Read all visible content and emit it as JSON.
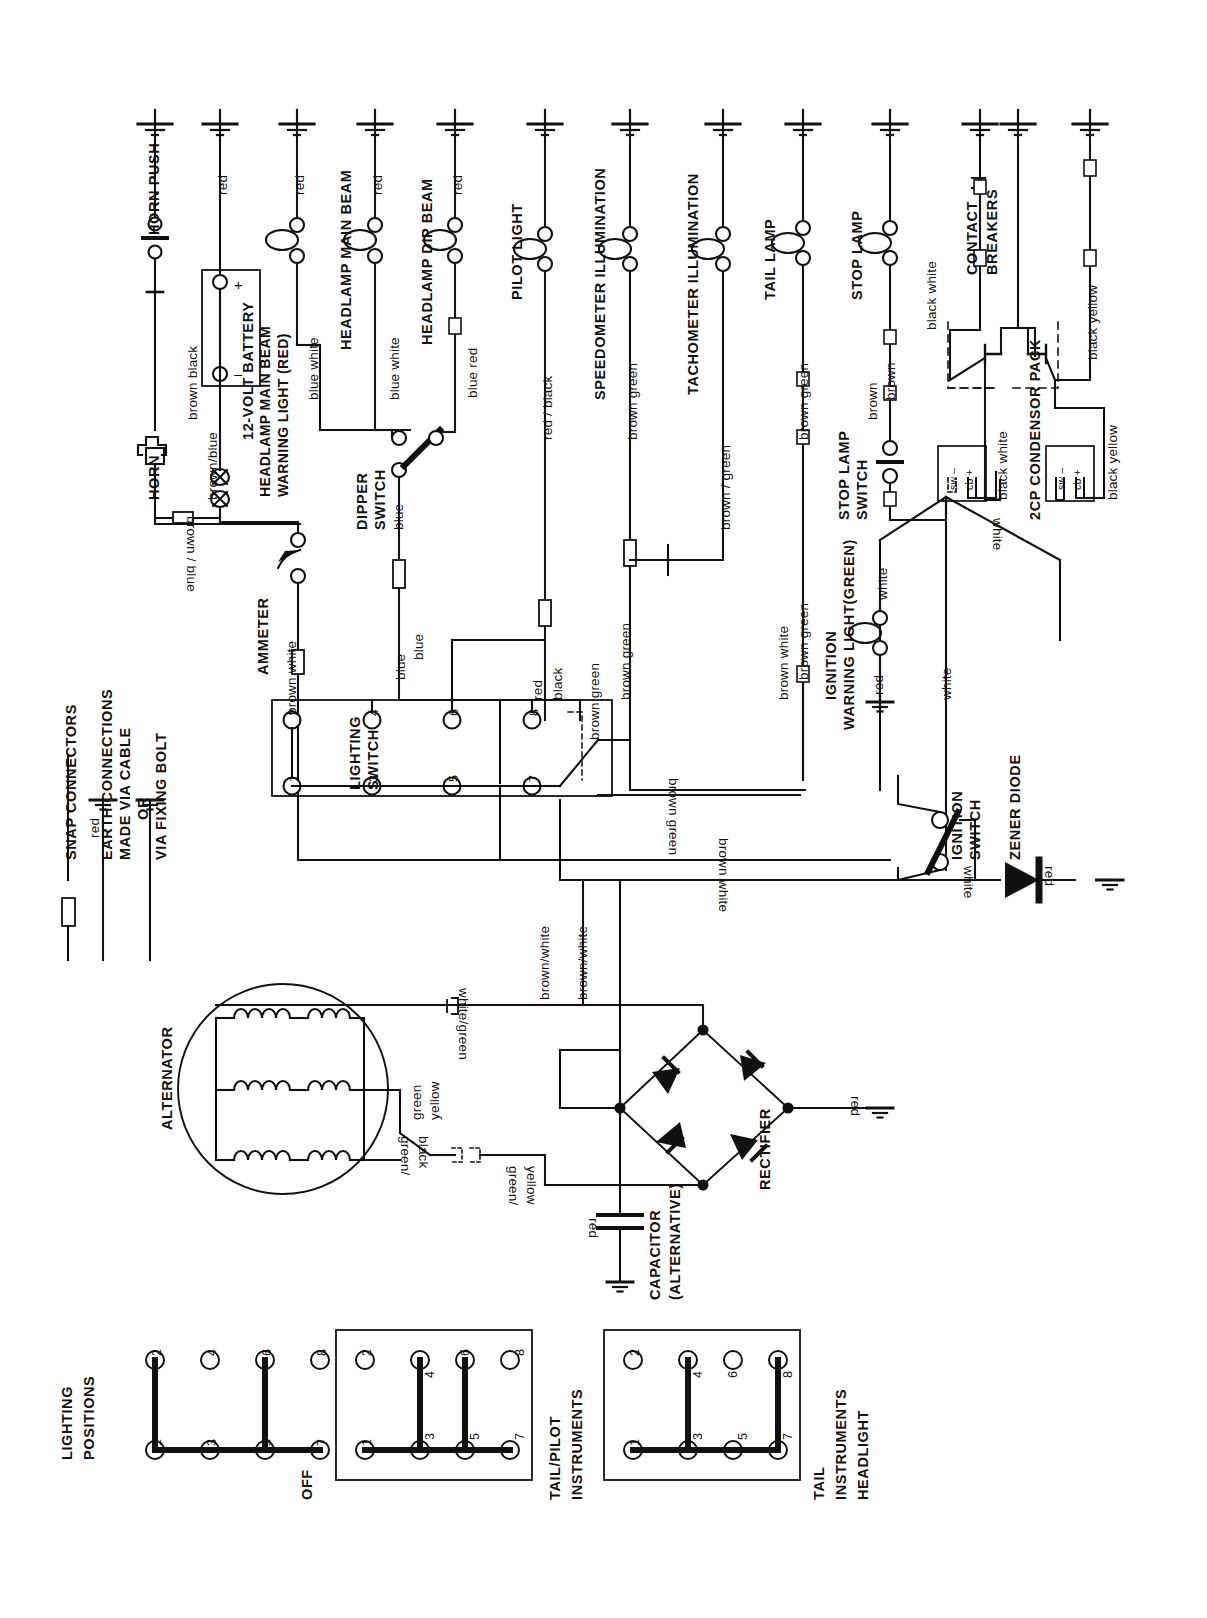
{
  "document": {
    "type": "automotive wiring diagram",
    "orientation": "rotated 90 degrees (labels read bottom-to-top)"
  },
  "legend": {
    "title": "",
    "items": [
      {
        "symbol": "snap-connector",
        "label": "SNAP CONNECTORS"
      },
      {
        "symbol": "earth-cable",
        "label": "EARTH CONNECTIONS MADE VIA CABLE",
        "wire": "red"
      },
      {
        "symbol": "or",
        "label": "OR"
      },
      {
        "symbol": "earth-bolt",
        "label": "VIA FIXING BOLT"
      }
    ],
    "line1": "SNAP CONNECTORS",
    "line2a": "EARTH CONNECTIONS",
    "line2b": "MADE VIA CABLE",
    "line2c": "OR",
    "line3": "VIA FIXING BOLT",
    "red_label": "red"
  },
  "components": {
    "horn": "HORN",
    "horn_push": "HORN PUSH",
    "battery": "12-VOLT BATTERY",
    "battery_plus": "+",
    "battery_minus": "–",
    "warning_light_main_beam": "HEADLAMP MAIN BEAM\nWARNING LIGHT (RED)",
    "warning_light_main_beam_l1": "HEADLAMP MAIN BEAM",
    "warning_light_main_beam_l2": "WARNING LIGHT (RED)",
    "headlamp_main_beam": "HEADLAMP MAIN BEAM",
    "headlamp_dip_beam": "HEADLAMP DIP BEAM",
    "dipper_switch_l1": "DIPPER",
    "dipper_switch_l2": "SWITCH",
    "pilot_light": "PILOT LIGHT",
    "speedometer_illumination": "SPEEDOMETER  ILLUMINATION",
    "tachometer_illumination": "TACHOMETER  ILLUMINATION",
    "tail_lamp": "TAIL LAMP",
    "stop_lamp": "STOP LAMP",
    "stop_lamp_switch_l1": "STOP LAMP",
    "stop_lamp_switch_l2": "SWITCH",
    "contact_breakers_l1": "CONTACT",
    "contact_breakers_l2": "BREAKERS",
    "condensor_pack": "2CP CONDENSOR PACK",
    "ignition_warning_light_l1": "IGNITION",
    "ignition_warning_light_l2": "WARNING LIGHT(GREEN)",
    "ammeter": "AMMETER",
    "lighting_switch_l1": "LIGHTING",
    "lighting_switch_l2": "SWITCH",
    "ignition_switch_l1": "IGNITION",
    "ignition_switch_l2": "SWITCH",
    "zener_diode": "ZENER DIODE",
    "alternator": "ALTERNATOR",
    "rectifier": "RECTIFIER",
    "capacitor_l1": "CAPACITOR",
    "capacitor_l2": "(ALTERNATIVE)",
    "condensor_terminal_sw": "sw –",
    "condensor_terminal_cb": "cb +"
  },
  "wire_labels": {
    "red": "red",
    "brown_black": "brown  black",
    "brown_blue": "brown/blue",
    "brown_blue2": "brown / blue",
    "blue_white": "blue  white",
    "blue_white2": "blue  white",
    "blue_red": "blue  red",
    "blue": "blue",
    "blue2": "blue",
    "blue3": "blue",
    "red_black": "red / black",
    "red_black2a": "red",
    "red_black2b": "black",
    "brown_green": "brown  green",
    "brown_green2": "brown / green",
    "brown_green3": "brown  green",
    "brown_green4": "brown  green",
    "brown_green5": "brown  green",
    "brown_green6": "brown  green",
    "brown_green7": "brown  green",
    "brown": "brown",
    "brown2": "brown",
    "brown_white": "brown  white",
    "brown_white2": "brown  white",
    "brown_white3": "brown white",
    "brown_white4": "brown/white",
    "brown_white5": "brown/white",
    "black_white": "black  white",
    "black_white2": "black  white",
    "black_white3": "black  white",
    "black_yellow": "black  yellow",
    "black_yellow2": "black  yellow",
    "white": "white",
    "white2": "white",
    "white3": "white",
    "white4": "white",
    "white_green": "white/green",
    "green_yellow_l1": "green",
    "green_yellow_l2": "yellow",
    "green_black_l1": "green/",
    "green_black_l2": "black",
    "green_yellow_b_l1": "green/",
    "green_yellow_b_l2": "yellow",
    "red_cap": "red",
    "red_rect": "red",
    "red_zener": "red",
    "red_ign": "red"
  },
  "lighting_switch": {
    "title_l1": "LIGHTING",
    "title_l2": "SWITCH",
    "terminals": [
      "1",
      "2",
      "3",
      "4",
      "5",
      "6",
      "7",
      "8"
    ]
  },
  "lighting_positions": {
    "title_l1": "LIGHTING",
    "title_l2": "POSITIONS",
    "positions": [
      {
        "name": "OFF",
        "lines": [
          "OFF"
        ],
        "terminals": [
          "1",
          "2",
          "3",
          "4",
          "5",
          "6",
          "7",
          "8"
        ],
        "bridges": [
          [
            "1",
            "2"
          ],
          [
            "1",
            "3"
          ],
          [
            "3",
            "5"
          ],
          [
            "5",
            "6"
          ],
          [
            "5",
            "7"
          ]
        ]
      },
      {
        "name": "TAIL/PILOT INSTRUMENTS",
        "lines": [
          "TAIL/PILOT",
          "INSTRUMENTS"
        ],
        "terminals": [
          "1",
          "2",
          "3",
          "4",
          "5",
          "6",
          "7",
          "8"
        ],
        "bridges": [
          [
            "1",
            "3"
          ],
          [
            "3",
            "4"
          ],
          [
            "3",
            "5"
          ],
          [
            "5",
            "6"
          ],
          [
            "5",
            "7"
          ]
        ]
      },
      {
        "name": "TAIL INSTRUMENTS HEADLIGHT",
        "lines": [
          "TAIL",
          "INSTRUMENTS",
          "HEADLIGHT"
        ],
        "terminals": [
          "1",
          "2",
          "3",
          "4",
          "5",
          "6",
          "7",
          "8"
        ],
        "bridges": [
          [
            "1",
            "3"
          ],
          [
            "3",
            "4"
          ],
          [
            "3",
            "5"
          ],
          [
            "5",
            "7"
          ],
          [
            "7",
            "8"
          ]
        ]
      }
    ]
  }
}
